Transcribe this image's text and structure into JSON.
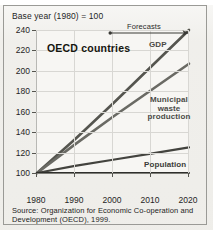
{
  "header": {
    "base_year_note": "Base year (1980) = 100"
  },
  "chart_data": {
    "type": "line",
    "title": "OECD countries",
    "subtitle": "Base year (1980) = 100",
    "xlabel": "",
    "ylabel": "",
    "xlim": [
      1980,
      2020
    ],
    "ylim": [
      100,
      240
    ],
    "grid": true,
    "legend_position": "inline-right",
    "x": [
      1980,
      1990,
      2000,
      2010,
      2020
    ],
    "xticklabels": [
      "1980",
      "1990",
      "2000",
      "2010",
      "2020"
    ],
    "yticks": [
      100,
      120,
      140,
      160,
      180,
      200,
      220,
      240
    ],
    "yticklabels": [
      "100",
      "120",
      "140",
      "160",
      "180",
      "200",
      "220",
      "240"
    ],
    "series": [
      {
        "name": "GDP",
        "color": "#55554f",
        "values": [
          100,
          133,
          168,
          204,
          240
        ]
      },
      {
        "name": "Municipal waste production",
        "color": "#6a6a64",
        "values": [
          100,
          128,
          155,
          181,
          207
        ]
      },
      {
        "name": "Population",
        "color": "#43433e",
        "values": [
          100,
          107,
          113,
          119,
          125
        ]
      },
      {
        "name": "Baseline",
        "color": "#2f2f2c",
        "values": [
          100,
          100,
          100,
          100,
          100
        ]
      }
    ],
    "annotations": [
      {
        "label": "Forecasts",
        "type": "double-arrow",
        "from_x": 2000,
        "to_x": 2020
      }
    ],
    "series_labels": {
      "gdp": "GDP",
      "waste_line1": "Municipal",
      "waste_line2": "waste",
      "waste_line3": "production",
      "population": "Population"
    }
  },
  "footer": {
    "source": "Source: Organization for Economic Co-operation and Development (OECD), 1999."
  }
}
